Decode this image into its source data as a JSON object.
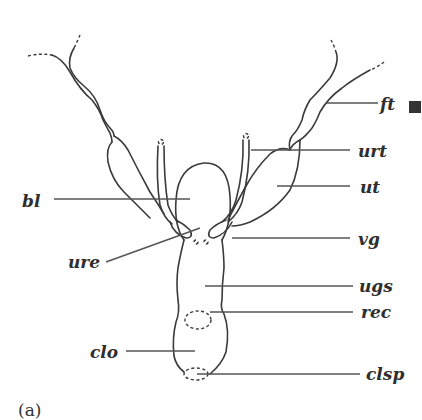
{
  "figure": {
    "caption": "(a)",
    "marker_color": "#333333",
    "line_color": "#3a3a3a"
  },
  "labels": {
    "ft": "ft",
    "urt": "urt",
    "ut": "ut",
    "bl": "bl",
    "vg": "vg",
    "ure": "ure",
    "ugs": "ugs",
    "rec": "rec",
    "clo": "clo",
    "clsp": "clsp"
  }
}
